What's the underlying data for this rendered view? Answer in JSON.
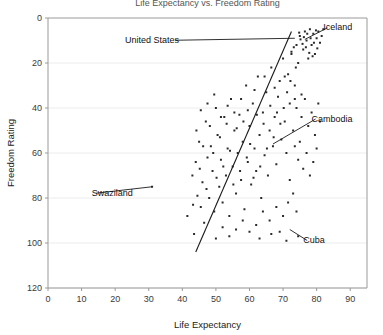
{
  "chart_data": {
    "type": "scatter",
    "title": "Life Expectancy vs. Freedom Rating",
    "xlabel": "Life Expectancy",
    "ylabel": "Freedom Rating",
    "xlim": [
      0,
      95
    ],
    "ylim": [
      0,
      120
    ],
    "y_inverted": true,
    "grid": "horizontal",
    "legend": "none",
    "xticks": [
      0,
      10,
      20,
      30,
      40,
      50,
      60,
      70,
      80,
      90
    ],
    "yticks": [
      0,
      20,
      40,
      60,
      80,
      100,
      120
    ],
    "xtick_labels": [
      "0",
      "10",
      "20",
      "30",
      "40",
      "50",
      "60",
      "70",
      "80",
      "90"
    ],
    "ytick_labels": [
      "0",
      "20",
      "40",
      "60",
      "80",
      "100",
      "120"
    ],
    "series": [
      {
        "name": "Countries",
        "marker": "square",
        "color": "#2b2b2b",
        "points": [
          [
            31.0,
            75.0
          ],
          [
            41.5,
            88.0
          ],
          [
            43.0,
            70.0
          ],
          [
            43.5,
            96.0
          ],
          [
            44.0,
            64.0
          ],
          [
            44.5,
            79.0
          ],
          [
            45.0,
            55.0
          ],
          [
            45.5,
            84.0
          ],
          [
            46.0,
            73.0
          ],
          [
            46.5,
            91.0
          ],
          [
            47.0,
            46.0
          ],
          [
            47.5,
            62.0
          ],
          [
            48.0,
            80.0
          ],
          [
            48.5,
            57.0
          ],
          [
            49.0,
            68.0
          ],
          [
            49.5,
            86.0
          ],
          [
            50.0,
            40.0
          ],
          [
            50.5,
            52.0
          ],
          [
            51.0,
            75.0
          ],
          [
            51.5,
            63.0
          ],
          [
            52.0,
            82.0
          ],
          [
            52.5,
            44.0
          ],
          [
            53.0,
            70.0
          ],
          [
            53.5,
            58.0
          ],
          [
            54.0,
            88.0
          ],
          [
            54.5,
            36.0
          ],
          [
            55.0,
            66.0
          ],
          [
            55.5,
            50.0
          ],
          [
            56.0,
            78.0
          ],
          [
            56.5,
            60.0
          ],
          [
            57.0,
            43.0
          ],
          [
            57.5,
            72.0
          ],
          [
            58.0,
            55.0
          ],
          [
            58.5,
            85.0
          ],
          [
            59.0,
            30.0
          ],
          [
            59.5,
            64.0
          ],
          [
            60.0,
            48.0
          ],
          [
            60.5,
            74.0
          ],
          [
            61.0,
            38.0
          ],
          [
            61.5,
            58.0
          ],
          [
            62.0,
            68.0
          ],
          [
            62.5,
            26.0
          ],
          [
            63.0,
            52.0
          ],
          [
            63.5,
            80.0
          ],
          [
            64.0,
            42.0
          ],
          [
            64.5,
            61.0
          ],
          [
            65.0,
            33.0
          ],
          [
            65.5,
            70.0
          ],
          [
            66.0,
            50.0
          ],
          [
            66.5,
            22.0
          ],
          [
            67.0,
            57.0
          ],
          [
            67.5,
            44.0
          ],
          [
            68.0,
            65.0
          ],
          [
            68.5,
            35.0
          ],
          [
            69.0,
            28.0
          ],
          [
            69.5,
            54.0
          ],
          [
            70.0,
            18.0
          ],
          [
            70.5,
            46.0
          ],
          [
            71.0,
            60.0
          ],
          [
            71.5,
            25.0
          ],
          [
            72.0,
            38.0
          ],
          [
            72.5,
            15.0
          ],
          [
            73.0,
            50.0
          ],
          [
            73.5,
            30.0
          ],
          [
            74.0,
            12.0
          ],
          [
            74.5,
            20.0
          ],
          [
            75.0,
            8.0
          ],
          [
            75.5,
            34.0
          ],
          [
            76.0,
            14.0
          ],
          [
            76.5,
            6.0
          ],
          [
            77.0,
            10.0
          ],
          [
            77.5,
            18.0
          ],
          [
            78.0,
            5.0
          ],
          [
            78.5,
            12.0
          ],
          [
            79.0,
            7.0
          ],
          [
            79.5,
            16.0
          ],
          [
            80.0,
            9.0
          ],
          [
            80.5,
            6.0
          ],
          [
            81.0,
            11.0
          ],
          [
            81.5,
            8.0
          ],
          [
            82.0,
            5.0
          ],
          [
            74.8,
            6.5
          ],
          [
            75.2,
            9.5
          ],
          [
            75.8,
            11.5
          ],
          [
            76.2,
            8.5
          ],
          [
            76.8,
            13.0
          ],
          [
            77.2,
            7.0
          ],
          [
            77.8,
            15.5
          ],
          [
            78.2,
            9.0
          ],
          [
            78.8,
            17.0
          ],
          [
            79.2,
            11.0
          ],
          [
            79.8,
            5.5
          ],
          [
            80.2,
            13.5
          ],
          [
            73.2,
            13.0
          ],
          [
            73.8,
            22.0
          ],
          [
            72.2,
            28.0
          ],
          [
            71.2,
            33.0
          ],
          [
            70.2,
            40.0
          ],
          [
            69.2,
            47.0
          ],
          [
            68.2,
            42.0
          ],
          [
            67.2,
            53.0
          ],
          [
            66.2,
            39.0
          ],
          [
            65.2,
            58.0
          ],
          [
            64.2,
            47.0
          ],
          [
            63.2,
            66.0
          ],
          [
            62.2,
            43.0
          ],
          [
            61.2,
            71.0
          ],
          [
            60.2,
            56.0
          ],
          [
            59.2,
            62.0
          ],
          [
            58.2,
            46.0
          ],
          [
            57.2,
            68.0
          ],
          [
            56.2,
            49.0
          ],
          [
            55.2,
            74.0
          ],
          [
            54.2,
            59.0
          ],
          [
            53.2,
            47.0
          ],
          [
            52.2,
            66.0
          ],
          [
            51.2,
            53.0
          ],
          [
            50.2,
            71.0
          ],
          [
            49.2,
            60.0
          ],
          [
            48.2,
            48.0
          ],
          [
            47.2,
            76.0
          ],
          [
            46.2,
            57.0
          ],
          [
            45.2,
            67.0
          ],
          [
            44.2,
            50.0
          ],
          [
            43.2,
            83.0
          ],
          [
            74.0,
            40.0
          ],
          [
            75.5,
            44.0
          ],
          [
            76.5,
            36.0
          ],
          [
            77.5,
            48.0
          ],
          [
            78.5,
            42.0
          ],
          [
            79.5,
            52.0
          ],
          [
            80.5,
            38.0
          ],
          [
            81.0,
            46.0
          ],
          [
            73.5,
            57.0
          ],
          [
            74.5,
            63.0
          ],
          [
            75.0,
            55.0
          ],
          [
            76.0,
            67.0
          ],
          [
            77.0,
            60.0
          ],
          [
            78.0,
            70.0
          ],
          [
            79.0,
            64.0
          ],
          [
            80.0,
            58.0
          ],
          [
            72.0,
            72.0
          ],
          [
            73.0,
            78.0
          ],
          [
            71.5,
            82.0
          ],
          [
            74.0,
            86.0
          ],
          [
            70.0,
            88.0
          ],
          [
            68.0,
            84.0
          ],
          [
            66.0,
            90.0
          ],
          [
            64.0,
            86.0
          ],
          [
            62.0,
            92.0
          ],
          [
            60.0,
            95.0
          ],
          [
            58.0,
            90.0
          ],
          [
            56.0,
            94.0
          ],
          [
            54.0,
            97.0
          ],
          [
            52.0,
            93.0
          ],
          [
            50.0,
            98.0
          ],
          [
            63.0,
            98.0
          ],
          [
            66.5,
            96.0
          ],
          [
            69.0,
            95.0
          ],
          [
            71.0,
            99.0
          ],
          [
            74.5,
            97.0
          ],
          [
            72.5,
            16.0
          ],
          [
            73.5,
            36.0
          ],
          [
            70.5,
            26.0
          ],
          [
            67.5,
            31.0
          ],
          [
            64.5,
            26.0
          ],
          [
            61.5,
            32.0
          ],
          [
            59.5,
            41.0
          ],
          [
            57.5,
            36.0
          ],
          [
            55.5,
            42.0
          ],
          [
            53.5,
            39.0
          ],
          [
            51.5,
            44.0
          ],
          [
            49.5,
            34.0
          ],
          [
            47.5,
            38.0
          ],
          [
            45.5,
            41.0
          ]
        ]
      }
    ],
    "trendline": {
      "type": "linear",
      "x_start": 44.0,
      "y_start": 104.0,
      "x_end": 72.5,
      "y_end": 6.0,
      "color": "#1a1a1a"
    },
    "annotations": [
      {
        "label": "United States",
        "label_x": 39.0,
        "label_y": 11.0,
        "point_x": 73.5,
        "point_y": 9.0,
        "align": "end"
      },
      {
        "label": "Iceland",
        "label_x": 82.0,
        "label_y": 5.5,
        "point_x": 76.5,
        "point_y": 9.5,
        "align": "start"
      },
      {
        "label": "Cambodia",
        "label_x": 78.5,
        "label_y": 46.0,
        "point_x": 67.0,
        "point_y": 56.0,
        "align": "start"
      },
      {
        "label": "Swaziland",
        "label_x": 13.0,
        "label_y": 79.0,
        "point_x": 31.0,
        "point_y": 75.0,
        "align": "start"
      },
      {
        "label": "Cuba",
        "label_x": 76.0,
        "label_y": 100.0,
        "point_x": 72.0,
        "point_y": 94.0,
        "align": "start"
      }
    ]
  }
}
